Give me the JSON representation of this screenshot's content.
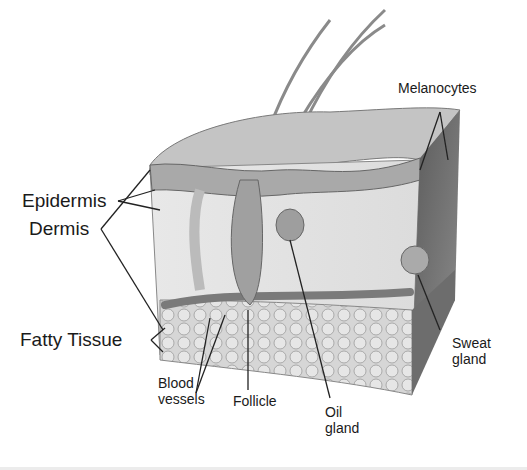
{
  "diagram": {
    "labels": {
      "epidermis": "Epidermis",
      "dermis": "Dermis",
      "fatty_tissue": "Fatty Tissue",
      "melanocytes": "Melanocytes",
      "sweat_gland_line1": "Sweat",
      "sweat_gland_line2": "gland",
      "blood_vessels_line1": "Blood",
      "blood_vessels_line2": "vessels",
      "follicle": "Follicle",
      "oil_gland_line1": "Oil",
      "oil_gland_line2": "gland"
    },
    "colors": {
      "background": "#ffffff",
      "text": "#1a1a1a",
      "leader_lines": "#222222",
      "skin_surface": "#bdbdbd",
      "dermis_fill": "#e2e2e2",
      "fat_fill": "#d0d0d0",
      "side_face": "#555555"
    }
  }
}
